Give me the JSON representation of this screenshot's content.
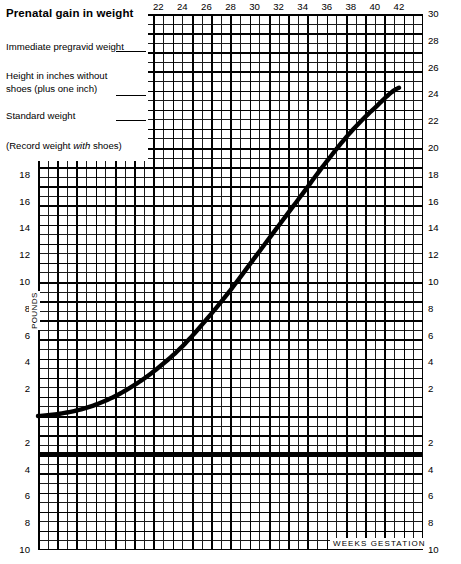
{
  "header": {
    "title": "Prenatal gain in weight",
    "fields": [
      {
        "label": "Immediate pregravid weight",
        "value": ""
      },
      {
        "label": "Height in inches without shoes (plus one inch)",
        "value": ""
      },
      {
        "label": "Standard weight",
        "value": ""
      },
      {
        "label": "(Record weight with shoes)",
        "value": ""
      }
    ]
  },
  "axis_titles": {
    "y": "POUNDS",
    "x": "WEEKS GESTATION"
  },
  "chart_data": {
    "type": "line",
    "title": "Prenatal gain in weight",
    "xlabel": "WEEKS GESTATION",
    "ylabel": "POUNDS",
    "xlim": [
      12,
      44
    ],
    "ylim": [
      -10,
      30
    ],
    "grid": true,
    "legend": "none",
    "x_ticks_top": [
      14,
      16,
      18,
      20,
      22,
      24,
      26,
      28,
      30,
      32,
      34,
      36,
      38,
      40,
      42
    ],
    "y_ticks_left": [
      28,
      26,
      24,
      22,
      20,
      18,
      16,
      14,
      12,
      10,
      8,
      6,
      4,
      2,
      2,
      4,
      6,
      8,
      10
    ],
    "y_ticks_right": [
      44,
      42,
      40,
      38,
      36,
      34,
      32,
      30,
      28,
      26,
      24,
      22,
      20,
      18,
      16,
      14,
      12,
      10,
      8,
      6,
      4,
      2,
      2,
      4,
      6,
      8,
      10
    ],
    "zero_reference_line": 0,
    "series": [
      {
        "name": "expected prenatal weight gain",
        "x": [
          12,
          14,
          16,
          18,
          20,
          22,
          24,
          26,
          28,
          30,
          32,
          34,
          36,
          38,
          40,
          42
        ],
        "y": [
          0,
          0.2,
          0.6,
          1.3,
          2.3,
          3.6,
          5.2,
          7.2,
          9.4,
          11.8,
          14.2,
          16.6,
          19.0,
          21.2,
          23.0,
          24.5
        ]
      }
    ]
  }
}
